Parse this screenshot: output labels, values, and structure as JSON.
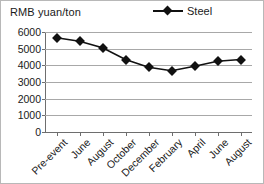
{
  "chart_data": {
    "type": "line",
    "title": "RMB yuan/ton",
    "xlabel": "",
    "ylabel": "RMB yuan/ton",
    "categories": [
      "Pre-event",
      "June",
      "August",
      "October",
      "December",
      "February",
      "April",
      "June",
      "August"
    ],
    "series": [
      {
        "name": "Steel",
        "values": [
          5650,
          5450,
          5050,
          4350,
          3880,
          3680,
          3950,
          4250,
          4350
        ],
        "color": "#111111",
        "marker": "diamond"
      }
    ],
    "ylim": [
      0,
      6000
    ],
    "ytick_values": [
      6000,
      5000,
      4000,
      3000,
      2000,
      1000,
      0
    ],
    "ytick_labels": [
      "6000",
      "5000",
      "4000",
      "3000",
      "2000",
      "1000",
      "0"
    ],
    "grid": true,
    "legend_position": "top-right"
  },
  "legend": {
    "entries": [
      {
        "label": "Steel"
      }
    ]
  },
  "axis": {
    "unit_title": "RMB yuan/ton"
  }
}
